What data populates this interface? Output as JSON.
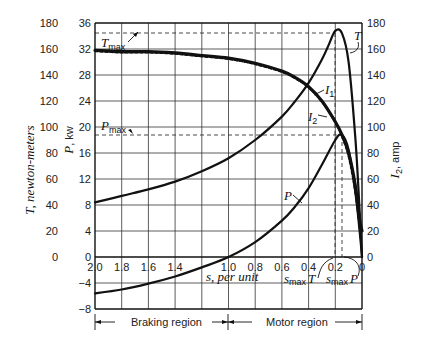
{
  "chart_data": {
    "type": "line",
    "title": "",
    "xlabel": "s, per unit",
    "x_axis": {
      "label": "s, per unit",
      "reversed": true,
      "range": [
        2.0,
        0
      ],
      "ticks": [
        "2.0",
        "1.8",
        "1.6",
        "1.4",
        "1.0",
        "0.8",
        "0.6",
        "0.4",
        "0.2",
        "0"
      ]
    },
    "y_axes": {
      "torque": {
        "label": "T, newton-meters",
        "range": [
          0,
          180
        ],
        "ticks": [
          "180",
          "160",
          "140",
          "120",
          "100",
          "80",
          "60",
          "40",
          "20",
          "0"
        ]
      },
      "power": {
        "label": "P, kw",
        "range": [
          -8,
          36
        ],
        "ticks": [
          "36",
          "32",
          "28",
          "24",
          "20",
          "16",
          "12",
          "8",
          "4",
          "0",
          "−4",
          "−8"
        ]
      },
      "current": {
        "label": "I2, amp",
        "range": [
          0,
          180
        ],
        "ticks": [
          "180",
          "160",
          "140",
          "120",
          "100",
          "80",
          "60",
          "40",
          "20",
          "0"
        ]
      }
    },
    "grid": true,
    "series": [
      {
        "name": "T",
        "unit": "newton-meters",
        "x": [
          2.0,
          1.8,
          1.6,
          1.4,
          1.2,
          1.0,
          0.8,
          0.6,
          0.5,
          0.4,
          0.3,
          0.25,
          0.2,
          0.15,
          0.1,
          0.05,
          0.02,
          0
        ],
        "values": [
          42,
          47,
          52,
          58,
          66,
          76,
          90,
          108,
          120,
          134,
          152,
          163,
          174,
          172,
          150,
          92,
          40,
          0
        ]
      },
      {
        "name": "I1",
        "unit": "amp",
        "x": [
          2.0,
          1.8,
          1.6,
          1.4,
          1.2,
          1.0,
          0.8,
          0.6,
          0.5,
          0.4,
          0.3,
          0.2,
          0.15,
          0.1,
          0.05,
          0.02,
          0
        ],
        "values": [
          159,
          158,
          158,
          157,
          155,
          153,
          149,
          143,
          138,
          131,
          120,
          104,
          94,
          80,
          55,
          30,
          20
        ]
      },
      {
        "name": "I2",
        "unit": "amp",
        "x": [
          2.0,
          1.8,
          1.6,
          1.4,
          1.2,
          1.0,
          0.8,
          0.6,
          0.5,
          0.4,
          0.3,
          0.2,
          0.15,
          0.1,
          0.05,
          0.02,
          0
        ],
        "values": [
          158,
          157,
          157,
          156,
          154,
          152,
          148,
          142,
          137,
          130,
          119,
          103,
          92,
          76,
          48,
          22,
          0
        ]
      },
      {
        "name": "P",
        "unit": "kw",
        "x": [
          2.0,
          1.8,
          1.6,
          1.4,
          1.2,
          1.0,
          0.8,
          0.6,
          0.5,
          0.4,
          0.3,
          0.2,
          0.15,
          0.1,
          0.05,
          0.02,
          0
        ],
        "values": [
          -5.6,
          -5.0,
          -4.1,
          -3.0,
          -1.6,
          0,
          2.3,
          5.6,
          7.8,
          10.6,
          14.2,
          18.0,
          18.8,
          16.5,
          10.0,
          4.5,
          0
        ]
      }
    ],
    "annotations": [
      {
        "text": "T_max",
        "value": 175,
        "axis": "torque",
        "style": "dashed horizontal"
      },
      {
        "text": "P_max",
        "value": 18.8,
        "axis": "power",
        "style": "dashed horizontal"
      },
      {
        "text": "s_max T",
        "value": 0.2,
        "axis": "x",
        "style": "dashed vertical"
      },
      {
        "text": "s_max P",
        "value": 0.15,
        "axis": "x",
        "style": "dashed vertical"
      },
      {
        "text": "Braking region",
        "x_range": [
          2.0,
          1.0
        ]
      },
      {
        "text": "Motor region",
        "x_range": [
          1.0,
          0
        ]
      }
    ],
    "legend_position": "inline curve labels"
  },
  "labels": {
    "torque_axis": "T, newton-meters",
    "power_axis_var": "P",
    "power_axis_unit": ", kw",
    "current_axis_var": "I",
    "current_axis_sub": "2",
    "current_axis_unit": ", amp",
    "x_axis": "s, per unit",
    "t_max": "T",
    "p_max": "P",
    "max_sub": "max",
    "curve_t": "T",
    "curve_i1": "I",
    "curve_i1_sub": "1",
    "curve_i2": "I",
    "curve_i2_sub": "2",
    "curve_p": "P",
    "s_max_t_s": "s",
    "s_max_t_rest": "max",
    "s_max_t_var": "T",
    "s_max_p_s": "s",
    "s_max_p_rest": "max",
    "s_max_p_var": "P",
    "braking_region": "Braking region",
    "motor_region": "Motor region"
  },
  "ticks": {
    "x": [
      "2.0",
      "1.8",
      "1.6",
      "1.4",
      "1.0",
      "0.8",
      "0.6",
      "0.4",
      "0.2",
      "0"
    ],
    "torque": [
      "180",
      "160",
      "140",
      "120",
      "100",
      "80",
      "60",
      "40",
      "20",
      "0"
    ],
    "power": [
      "36",
      "32",
      "28",
      "24",
      "20",
      "16",
      "12",
      "8",
      "4",
      "0",
      "−4",
      "−8"
    ],
    "current": [
      "180",
      "160",
      "140",
      "120",
      "100",
      "80",
      "60",
      "40",
      "20",
      "0"
    ]
  }
}
